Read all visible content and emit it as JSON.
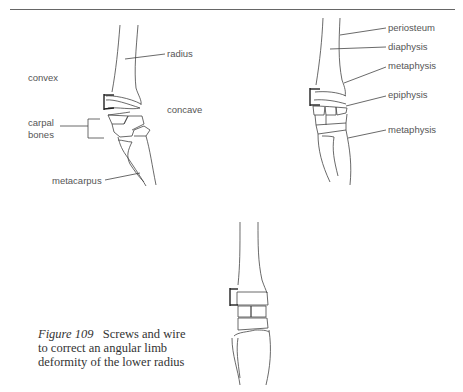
{
  "page": {
    "header_rule": true
  },
  "figure_left": {
    "labels": {
      "radius": "radius",
      "convex": "convex",
      "concave": "concave",
      "carpal_bones_line1": "carpal",
      "carpal_bones_line2": "bones",
      "metacarpus": "metacarpus"
    }
  },
  "figure_right": {
    "labels": {
      "periosteum": "periosteum",
      "diaphysis": "diaphysis",
      "metaphysis_upper": "metaphysis",
      "epiphysis": "epiphysis",
      "metaphysis_lower": "metaphysis"
    }
  },
  "caption": {
    "figure_number": "Figure 109",
    "text": "Screws and wire to correct an angular limb deformity of the lower radius"
  }
}
